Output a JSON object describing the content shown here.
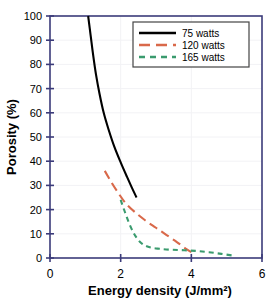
{
  "chart_data": {
    "type": "line",
    "title": "",
    "xlabel": "Energy density (J/mm²)",
    "ylabel": "Porosity (%)",
    "xlim": [
      0,
      6
    ],
    "ylim": [
      0,
      100
    ],
    "xticks": [
      0,
      2,
      4,
      6
    ],
    "yticks": [
      0,
      10,
      20,
      30,
      40,
      50,
      60,
      70,
      80,
      90,
      100
    ],
    "xtick_labels": [
      "0",
      "2",
      "4",
      "6"
    ],
    "ytick_labels": [
      "0",
      "10",
      "20",
      "30",
      "40",
      "50",
      "60",
      "70",
      "80",
      "90",
      "100"
    ],
    "grid": true,
    "legend_position": "upper right",
    "series": [
      {
        "name": "75   watts",
        "color": "#000000",
        "dash": "solid",
        "points": [
          [
            1.08,
            100.0
          ],
          [
            1.15,
            92.0
          ],
          [
            1.22,
            84.0
          ],
          [
            1.3,
            76.0
          ],
          [
            1.4,
            68.0
          ],
          [
            1.52,
            60.0
          ],
          [
            1.66,
            53.0
          ],
          [
            1.82,
            46.0
          ],
          [
            2.0,
            39.5
          ],
          [
            2.18,
            33.5
          ],
          [
            2.32,
            29.0
          ],
          [
            2.45,
            25.0
          ]
        ]
      },
      {
        "name": "120 watts",
        "color": "#d9694a",
        "dash": "dashed-long",
        "points": [
          [
            1.55,
            36.0
          ],
          [
            1.75,
            31.0
          ],
          [
            1.95,
            26.5
          ],
          [
            2.15,
            22.5
          ],
          [
            2.4,
            19.0
          ],
          [
            2.7,
            15.5
          ],
          [
            3.0,
            12.5
          ],
          [
            3.3,
            9.5
          ],
          [
            3.6,
            6.5
          ],
          [
            3.85,
            3.8
          ],
          [
            4.0,
            2.4
          ]
        ]
      },
      {
        "name": "165 watts",
        "color": "#3a9b6e",
        "dash": "dashed-short",
        "points": [
          [
            2.0,
            24.0
          ],
          [
            2.12,
            19.0
          ],
          [
            2.25,
            14.0
          ],
          [
            2.4,
            9.5
          ],
          [
            2.58,
            6.2
          ],
          [
            2.8,
            4.5
          ],
          [
            3.1,
            3.8
          ],
          [
            3.45,
            3.4
          ],
          [
            3.8,
            3.2
          ],
          [
            4.15,
            2.9
          ],
          [
            4.5,
            2.4
          ],
          [
            4.85,
            1.7
          ],
          [
            5.18,
            1.0
          ]
        ]
      }
    ]
  },
  "legend": {
    "entries": [
      {
        "label": "75   watts"
      },
      {
        "label": "120 watts"
      },
      {
        "label": "165 watts"
      }
    ]
  },
  "colors": {
    "axis": "#3b3b7a",
    "grid": "#f2f2f5",
    "series_75": "#000000",
    "series_120": "#d9694a",
    "series_165": "#3a9b6e",
    "background": "#ffffff"
  }
}
